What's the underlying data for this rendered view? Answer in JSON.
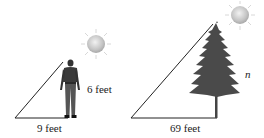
{
  "diagram": {
    "left": {
      "person_height_label": "6 feet",
      "shadow_label": "9 feet"
    },
    "right": {
      "tree_height_label": "n",
      "shadow_label": "69 feet"
    }
  }
}
